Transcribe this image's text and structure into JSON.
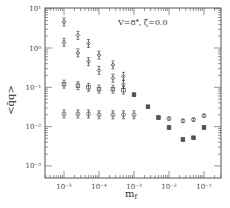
{
  "chart_data": {
    "type": "scatter",
    "title": "",
    "annotation": "V=8⁴,  ζ=0.0",
    "xlabel": "m_f",
    "ylabel": "<q̄q>",
    "xscale": "log",
    "yscale": "log",
    "xlim": [
      3e-06,
      0.2
    ],
    "ylim": [
      0.001,
      10
    ],
    "grid": false,
    "legend": null,
    "x_tick_labels": [
      "10⁻⁵",
      "10⁻⁴",
      "10⁻³",
      "10⁻²",
      "10⁻¹"
    ],
    "x_ticks": [
      1e-05,
      0.0001,
      0.001,
      0.01,
      0.1
    ],
    "y_tick_labels": [
      "10¹",
      "10⁰",
      "10⁻¹",
      "10⁻²",
      "10⁻³"
    ],
    "y_ticks": [
      10,
      1,
      0.1,
      0.01,
      0.001
    ],
    "series": [
      {
        "name": "series-1",
        "marker": "diamond-errorbar",
        "x": [
          1e-05,
          2.5e-05,
          5e-05,
          0.0001,
          0.00025,
          0.0005
        ],
        "y": [
          4.6,
          2.1,
          1.3,
          0.66,
          0.37,
          0.19
        ]
      },
      {
        "name": "series-2",
        "marker": "diamond-errorbar",
        "x": [
          1e-05,
          2.5e-05,
          5e-05,
          0.0001,
          0.00025,
          0.0005
        ],
        "y": [
          1.4,
          0.75,
          0.45,
          0.27,
          0.17,
          0.12
        ]
      },
      {
        "name": "series-3",
        "marker": "square-errorbar",
        "x": [
          1e-05,
          2.5e-05,
          5e-05,
          0.0001,
          0.00025,
          0.0005
        ],
        "y": [
          0.12,
          0.11,
          0.1,
          0.09,
          0.09,
          0.085
        ]
      },
      {
        "name": "series-4",
        "marker": "circle-errorbar",
        "x": [
          1e-05,
          2.5e-05,
          5e-05,
          0.0001,
          0.00025,
          0.0005,
          0.001
        ],
        "y": [
          0.021,
          0.021,
          0.021,
          0.02,
          0.02,
          0.02,
          0.02
        ]
      },
      {
        "name": "merged",
        "marker": "square",
        "x": [
          0.001,
          0.0025,
          0.005,
          0.01,
          0.025,
          0.05,
          0.1
        ],
        "y": [
          0.065,
          0.032,
          0.017,
          0.0095,
          0.0047,
          0.0052,
          0.0095
        ]
      },
      {
        "name": "circles-high-mass",
        "marker": "circle",
        "x": [
          0.01,
          0.025,
          0.05,
          0.1
        ],
        "y": [
          0.016,
          0.014,
          0.015,
          0.019
        ]
      }
    ]
  },
  "plot": {
    "annotation": "V=8⁴,  ζ=0.0",
    "xlabel": "m",
    "xlabel_sub": "f",
    "ylabel": "<q̄q>"
  }
}
